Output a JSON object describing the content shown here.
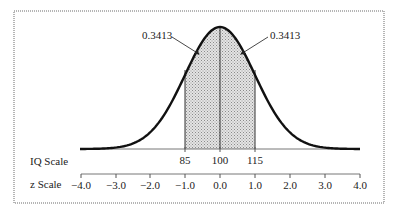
{
  "chart_data": {
    "type": "area",
    "title": "",
    "distribution": {
      "name": "normal",
      "mean_iq": 100,
      "sd_iq": 15,
      "mean_z": 0,
      "sd_z": 1
    },
    "shaded_region": {
      "z_from": -1.0,
      "z_to": 1.0,
      "iq_from": 85,
      "iq_to": 115
    },
    "annotations": [
      {
        "label": "0.3413",
        "region": "z -1.0 to 0.0",
        "side": "left"
      },
      {
        "label": "0.3413",
        "region": "z 0.0 to 1.0",
        "side": "right"
      }
    ],
    "scales": [
      {
        "name": "IQ Scale",
        "ticks": [
          85,
          100,
          115
        ]
      },
      {
        "name": "z Scale",
        "ticks": [
          -4.0,
          -3.0,
          -2.0,
          -1.0,
          0.0,
          1.0,
          2.0,
          3.0,
          4.0
        ]
      }
    ],
    "xlim": [
      -4.0,
      4.0
    ],
    "grid": false,
    "legend": null
  },
  "labels": {
    "left_area": "0.3413",
    "right_area": "0.3413",
    "iq_scale": "IQ Scale",
    "z_scale": "z Scale"
  },
  "iq_ticks": [
    "85",
    "100",
    "115"
  ],
  "z_ticks": [
    "−4.0",
    "−3.0",
    "−2.0",
    "−1.0",
    "0.0",
    "1.0",
    "2.0",
    "3.0",
    "4.0"
  ],
  "colors": {
    "curve": "#111111",
    "shade": "#c8c8c8",
    "frame": "#b0b0b0",
    "text": "#222222"
  }
}
